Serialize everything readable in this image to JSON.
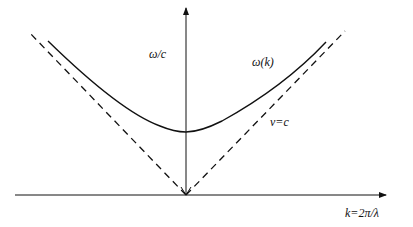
{
  "diagram": {
    "labels": {
      "y_axis": "ω/c",
      "curve": "ω(k)",
      "asymptote": "v=c",
      "x_axis": "k=2π/λ"
    },
    "colors": {
      "line": "#111111",
      "background": "#ffffff"
    }
  }
}
